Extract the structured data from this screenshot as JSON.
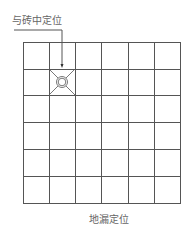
{
  "diagram": {
    "callout_label": "与砖中定位",
    "caption": "地漏定位",
    "grid": {
      "rows": 6,
      "cols": 6,
      "x0": 23,
      "y0": 42,
      "x1": 180,
      "y1": 203,
      "line_color": "#555555"
    },
    "marker": {
      "type": "floor-drain",
      "cell_col": 1,
      "cell_row": 1,
      "center_x": 62,
      "center_y": 82
    },
    "leader": {
      "from_x": 14,
      "from_y": 30,
      "corner_x": 62,
      "to_y": 68
    }
  }
}
